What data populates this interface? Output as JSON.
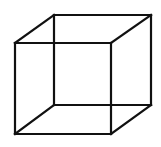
{
  "diagram": {
    "type": "necker-cube",
    "stroke_color": "#111111",
    "background": "#ffffff",
    "front_face": {
      "x1": 15,
      "y1": 43,
      "x2": 111,
      "y2": 134
    },
    "back_face": {
      "x1": 54,
      "y1": 15,
      "x2": 151,
      "y2": 105
    }
  }
}
